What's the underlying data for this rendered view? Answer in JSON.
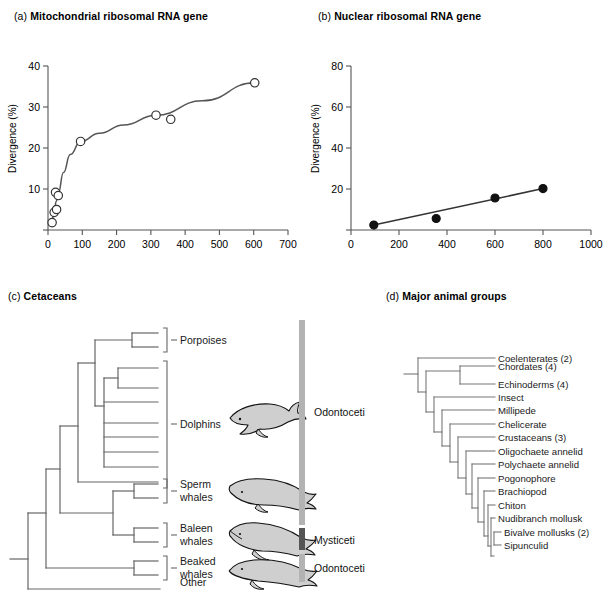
{
  "figure": {
    "background": "#ffffff",
    "line_color": "#555555",
    "text_color": "#1a1a1a"
  },
  "panels": {
    "a": {
      "tag": "(a)",
      "title": "Mitochondrial ribosomal RNA gene"
    },
    "b": {
      "tag": "(b)",
      "title": "Nuclear ribosomal RNA gene"
    },
    "c": {
      "tag": "(c)",
      "title": "Cetaceans"
    },
    "d": {
      "tag": "(d)",
      "title": "Major animal groups"
    }
  },
  "chart_data": [
    {
      "type": "scatter",
      "panel": "a",
      "title": "Mitochondrial ribosomal RNA gene",
      "xlabel": "",
      "ylabel": "Divergence (%)",
      "xlim": [
        0,
        700
      ],
      "ylim": [
        0,
        40
      ],
      "xticks": [
        0,
        100,
        200,
        300,
        400,
        500,
        600,
        700
      ],
      "yticks": [
        0,
        10,
        20,
        30,
        40
      ],
      "ytick_labels": [
        "",
        "10",
        "20",
        "30",
        "40"
      ],
      "grid": false,
      "legend": "none",
      "marker": "open-circle",
      "points": [
        {
          "x": 12,
          "y": 1.8
        },
        {
          "x": 18,
          "y": 4.3
        },
        {
          "x": 25,
          "y": 5.0
        },
        {
          "x": 22,
          "y": 9.2
        },
        {
          "x": 30,
          "y": 8.4
        },
        {
          "x": 95,
          "y": 21.6
        },
        {
          "x": 315,
          "y": 28.0
        },
        {
          "x": 358,
          "y": 27.0
        },
        {
          "x": 603,
          "y": 35.9
        }
      ],
      "fit_curve": {
        "style": "smooth-saturating",
        "points": [
          {
            "x": 10,
            "y": 1.5
          },
          {
            "x": 18,
            "y": 4.4
          },
          {
            "x": 24,
            "y": 7.0
          },
          {
            "x": 30,
            "y": 9.0
          },
          {
            "x": 45,
            "y": 14.0
          },
          {
            "x": 65,
            "y": 18.4
          },
          {
            "x": 95,
            "y": 21.6
          },
          {
            "x": 150,
            "y": 23.6
          },
          {
            "x": 220,
            "y": 25.6
          },
          {
            "x": 315,
            "y": 28.0
          },
          {
            "x": 450,
            "y": 31.5
          },
          {
            "x": 603,
            "y": 35.9
          }
        ]
      }
    },
    {
      "type": "scatter",
      "panel": "b",
      "title": "Nuclear ribosomal RNA gene",
      "xlabel": "",
      "ylabel": "Divergence (%)",
      "xlim": [
        0,
        1000
      ],
      "ylim": [
        0,
        80
      ],
      "xticks": [
        0,
        200,
        400,
        600,
        800,
        1000
      ],
      "yticks": [
        0,
        20,
        40,
        60,
        80
      ],
      "ytick_labels": [
        "",
        "20",
        "40",
        "60",
        "80"
      ],
      "grid": false,
      "legend": "none",
      "marker": "filled-circle",
      "points": [
        {
          "x": 95,
          "y": 2.4
        },
        {
          "x": 355,
          "y": 5.6
        },
        {
          "x": 600,
          "y": 15.6
        },
        {
          "x": 800,
          "y": 20.2
        }
      ],
      "fit_curve": {
        "style": "linear",
        "points": [
          {
            "x": 95,
            "y": 2.4
          },
          {
            "x": 800,
            "y": 20.2
          }
        ]
      }
    }
  ],
  "cetacean_tree": {
    "tips": [
      {
        "id": "porpoises",
        "label": "Porpoises",
        "illustration": "none"
      },
      {
        "id": "dolphins",
        "label": "Dolphins",
        "illustration": "dolphin"
      },
      {
        "id": "sperm-whales",
        "label": "Sperm\nwhales",
        "line1": "Sperm",
        "line2": "whales",
        "illustration": "sperm-whale"
      },
      {
        "id": "baleen-whales",
        "label": "Baleen\nwhales",
        "line1": "Baleen",
        "line2": "whales",
        "illustration": "baleen-whale"
      },
      {
        "id": "beaked-whales",
        "label": "Beaked\nwhales",
        "line1": "Beaked",
        "line2": "whales",
        "illustration": "beaked-whale"
      },
      {
        "id": "other-mammals",
        "label": "Other\nmammals",
        "line1": "Other",
        "line2": "mammals",
        "illustration": "none"
      }
    ],
    "groups": [
      {
        "id": "odontoceti-upper",
        "label": "Odontoceti",
        "color": "#b3b3b3"
      },
      {
        "id": "mysticeti",
        "label": "Mysticeti",
        "color": "#555555"
      },
      {
        "id": "odontoceti-lower",
        "label": "Odontoceti",
        "color": "#b3b3b3"
      }
    ]
  },
  "animal_tree": {
    "tips": [
      {
        "label": "Coelenterates (2)"
      },
      {
        "label": "Chordates (4)"
      },
      {
        "label": "Echinoderms (4)"
      },
      {
        "label": "Insect"
      },
      {
        "label": "Millipede"
      },
      {
        "label": "Chelicerate"
      },
      {
        "label": "Crustaceans (3)"
      },
      {
        "label": "Oligochaete annelid"
      },
      {
        "label": "Polychaete annelid"
      },
      {
        "label": "Pogonophore"
      },
      {
        "label": "Brachiopod"
      },
      {
        "label": "Chiton"
      },
      {
        "label": "Nudibranch mollusk"
      },
      {
        "label": "Bivalve mollusks (2)"
      },
      {
        "label": "Sipunculid"
      }
    ]
  }
}
